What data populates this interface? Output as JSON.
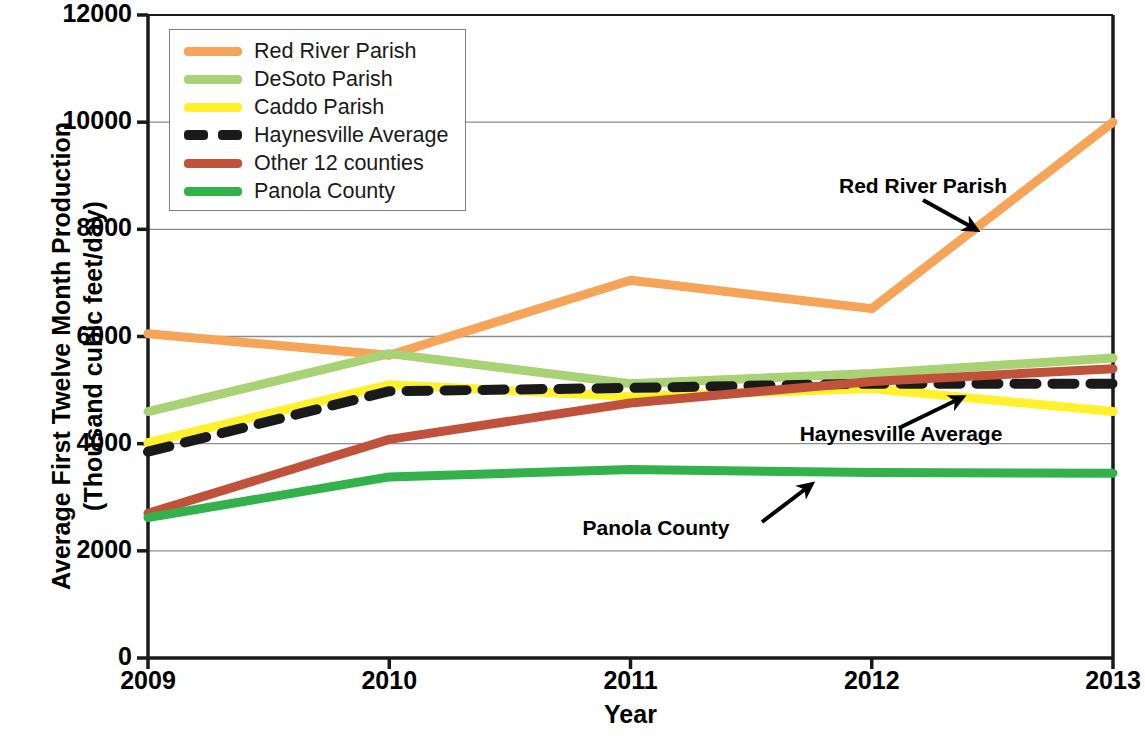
{
  "chart_data": {
    "type": "line",
    "title": "",
    "xlabel": "Year",
    "ylabel": "Average First Twelve Month Production (Thousand cubic feet/day)",
    "ylabel_line1": "Average First Twelve Month Production",
    "ylabel_line2": "(Thousand cubic feet/day)",
    "x": [
      2009,
      2010,
      2011,
      2012,
      2013
    ],
    "categories": [
      "2009",
      "2010",
      "2011",
      "2012",
      "2013"
    ],
    "xlim": [
      2009,
      2013
    ],
    "ylim": [
      0,
      12000
    ],
    "ytick_labels": [
      "0",
      "2000",
      "4000",
      "6000",
      "8000",
      "10000",
      "12000"
    ],
    "ytick_values": [
      0,
      2000,
      4000,
      6000,
      8000,
      10000,
      12000
    ],
    "grid": "horizontal",
    "legend_position": "top-left-inside",
    "series": [
      {
        "name": "Red River Parish",
        "color": "#F5A458",
        "style": "solid",
        "values": [
          6050,
          5650,
          7050,
          6520,
          10000
        ]
      },
      {
        "name": "DeSoto Parish",
        "color": "#A9D275",
        "style": "solid",
        "values": [
          4600,
          5680,
          5120,
          5310,
          5600
        ]
      },
      {
        "name": "Caddo Parish",
        "color": "#FFF22D",
        "style": "solid",
        "values": [
          4020,
          5100,
          4880,
          5030,
          4600
        ]
      },
      {
        "name": "Haynesville Average",
        "color": "#1A1A1A",
        "style": "dashed",
        "values": [
          3850,
          4980,
          5040,
          5120,
          5120
        ]
      },
      {
        "name": "Other 12 counties",
        "color": "#C0523C",
        "style": "solid",
        "values": [
          2700,
          4080,
          4760,
          5160,
          5400
        ]
      },
      {
        "name": "Panola County",
        "color": "#33B24B",
        "style": "solid",
        "values": [
          2620,
          3380,
          3520,
          3460,
          3450
        ]
      }
    ],
    "annotations": [
      {
        "text": "Red River Parish",
        "target_series": "Red River Parish",
        "label_x": 923,
        "label_y": 186,
        "arrow_from": [
          923,
          200
        ],
        "arrow_to": [
          977,
          230
        ]
      },
      {
        "text": "Haynesville Average",
        "target_series": "Haynesville Average",
        "label_x": 901,
        "label_y": 434,
        "arrow_from": [
          899,
          428
        ],
        "arrow_to": [
          963,
          397
        ]
      },
      {
        "text": "Panola County",
        "target_series": "Panola County",
        "label_x": 656,
        "label_y": 528,
        "arrow_from": [
          762,
          522
        ],
        "arrow_to": [
          812,
          484
        ]
      }
    ]
  },
  "legend": {
    "items": [
      {
        "label": "Red River Parish",
        "color": "#F5A458",
        "style": "solid"
      },
      {
        "label": "DeSoto Parish",
        "color": "#A9D275",
        "style": "solid"
      },
      {
        "label": "Caddo Parish",
        "color": "#FFF22D",
        "style": "solid"
      },
      {
        "label": "Haynesville Average",
        "color": "#1A1A1A",
        "style": "dashed"
      },
      {
        "label": "Other 12 counties",
        "color": "#C0523C",
        "style": "solid"
      },
      {
        "label": "Panola County",
        "color": "#33B24B",
        "style": "solid"
      }
    ]
  },
  "colors": {
    "axis": "#1A1A1A",
    "grid": "#8C8C8C",
    "background": "#FFFFFF",
    "text": "#000000"
  }
}
